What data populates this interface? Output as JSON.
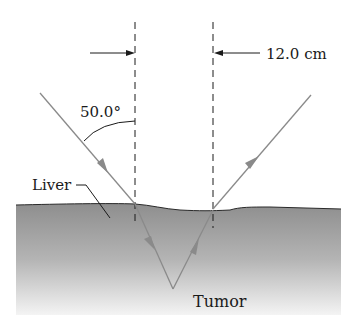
{
  "diagram": {
    "labels": {
      "separation": "12.0 cm",
      "angle": "50.0°",
      "liver": "Liver",
      "tumor": "Tumor"
    },
    "colors": {
      "ray": "#8a8a8a",
      "tissue_top": "#8c8c8c",
      "tissue_bottom": "#f2f2f2",
      "line": "#1a1a1a"
    }
  }
}
